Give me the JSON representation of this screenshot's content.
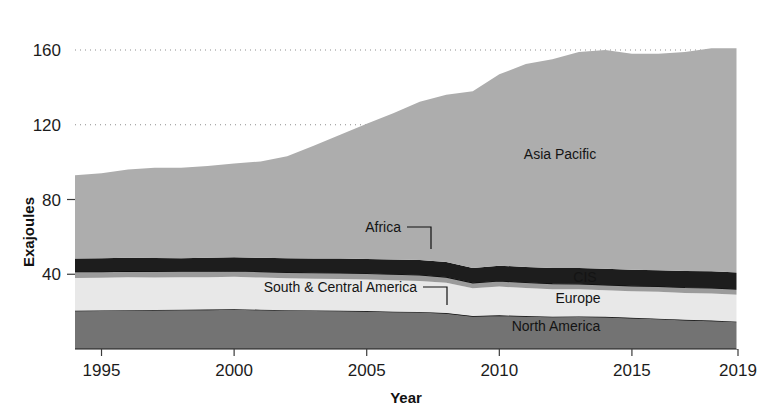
{
  "chart_data": {
    "type": "area",
    "stacked": true,
    "title": "",
    "xlabel": "Year",
    "ylabel": "Exajoules",
    "x": [
      1994,
      1995,
      1996,
      1997,
      1998,
      1999,
      2000,
      2001,
      2002,
      2003,
      2004,
      2005,
      2006,
      2007,
      2008,
      2009,
      2010,
      2011,
      2012,
      2013,
      2014,
      2015,
      2016,
      2017,
      2018,
      2019
    ],
    "xlim": [
      1994,
      2019
    ],
    "ylim": [
      0,
      166
    ],
    "xticks": [
      1995,
      2000,
      2005,
      2010,
      2015,
      2019
    ],
    "yticks": [
      40,
      80,
      120,
      160
    ],
    "gridlines": [
      120,
      160
    ],
    "grid": "dotted-horizontal",
    "legend": "inline-labels",
    "series": [
      {
        "name": "North America",
        "color": "#737373",
        "values": [
          20.5,
          20.6,
          20.8,
          20.9,
          21.0,
          21.1,
          21.3,
          21.0,
          20.8,
          20.6,
          20.5,
          20.3,
          20.0,
          19.8,
          19.2,
          17.6,
          18.0,
          17.6,
          17.3,
          17.4,
          17.2,
          16.7,
          16.2,
          15.6,
          15.2,
          14.6
        ]
      },
      {
        "name": "Europe",
        "color": "#e8e8e8",
        "values": [
          17.5,
          17.5,
          17.6,
          17.4,
          17.4,
          17.3,
          17.3,
          17.2,
          17.0,
          17.0,
          17.0,
          16.9,
          16.8,
          16.6,
          16.2,
          14.9,
          15.4,
          15.0,
          14.7,
          14.6,
          14.2,
          14.2,
          14.4,
          14.4,
          14.5,
          14.4
        ]
      },
      {
        "name": "CIS",
        "color": "#9b9b9b",
        "values": [
          3.4,
          3.3,
          3.3,
          3.2,
          3.2,
          3.2,
          3.2,
          3.2,
          3.2,
          3.2,
          3.2,
          3.2,
          3.2,
          3.2,
          3.1,
          2.9,
          3.0,
          3.0,
          3.0,
          2.9,
          2.9,
          2.9,
          2.9,
          2.9,
          3.0,
          3.0
        ]
      },
      {
        "name": "Africa",
        "color": "#1d1d1d",
        "values": [
          7.0,
          7.1,
          7.2,
          7.2,
          7.0,
          7.2,
          7.3,
          7.4,
          7.5,
          7.6,
          7.7,
          7.8,
          7.9,
          8.0,
          8.1,
          8.0,
          8.2,
          8.3,
          8.4,
          8.5,
          8.6,
          8.6,
          8.7,
          8.8,
          8.9,
          8.9
        ]
      },
      {
        "name": "South & Central America",
        "color": "#e0e0e0",
        "values": [
          0.0,
          0.0,
          0.0,
          0.0,
          0.0,
          0.0,
          0.0,
          0.0,
          0.0,
          0.0,
          0.0,
          0.0,
          0.0,
          0.0,
          0.0,
          0.0,
          0.0,
          0.0,
          0.0,
          0.0,
          0.0,
          0.0,
          0.0,
          0.0,
          0.0,
          0.0
        ]
      },
      {
        "name": "Asia Pacific",
        "color": "#adadad",
        "values": [
          44.6,
          45.5,
          47.1,
          48.3,
          48.4,
          49.2,
          50.2,
          51.6,
          54.7,
          60.4,
          66.3,
          72.3,
          78.3,
          84.7,
          89.4,
          94.6,
          102.4,
          108.6,
          111.6,
          115.6,
          117.1,
          115.6,
          115.8,
          117.3,
          119.4,
          120.1
        ]
      }
    ],
    "totals": [
      93.0,
      94.0,
      96.0,
      97.0,
      97.0,
      98.0,
      99.3,
      100.4,
      103.2,
      108.8,
      114.7,
      120.5,
      126.2,
      132.3,
      136.0,
      138.0,
      147.0,
      152.5,
      155.0,
      159.0,
      160.0,
      158.0,
      158.0,
      159.0,
      161.0,
      161.0
    ],
    "series_labels": [
      {
        "name": "asia-pacific",
        "text": "Asia Pacific",
        "x": 560,
        "y": 159,
        "anchor": "middle",
        "leader": false
      },
      {
        "name": "africa",
        "text": "Africa",
        "x": 401,
        "y": 232,
        "anchor": "end",
        "leader": true
      },
      {
        "name": "cis",
        "text": "CIS",
        "x": 585,
        "y": 282,
        "anchor": "middle",
        "leader": false
      },
      {
        "name": "europe",
        "text": "Europe",
        "x": 578,
        "y": 303,
        "anchor": "middle",
        "leader": false
      },
      {
        "name": "south-central-america",
        "text": "South & Central America",
        "x": 417,
        "y": 292,
        "anchor": "end",
        "leader": true
      },
      {
        "name": "north-america",
        "text": "North America",
        "x": 556,
        "y": 331,
        "anchor": "middle",
        "leader": false
      }
    ]
  },
  "axes": {
    "y_label": "Exajoules",
    "x_label": "Year",
    "y_ticks": [
      "160",
      "120",
      "80",
      "40"
    ],
    "x_ticks": [
      "1995",
      "2000",
      "2005",
      "2010",
      "2015",
      "2019"
    ]
  },
  "colors": {
    "asia_pacific": "#adadad",
    "africa": "#1d1d1d",
    "cis": "#9b9b9b",
    "europe": "#e8e8e8",
    "north_america": "#737373",
    "grid": "#8d8d8d",
    "text": "#1a1a1a",
    "background": "#ffffff"
  }
}
